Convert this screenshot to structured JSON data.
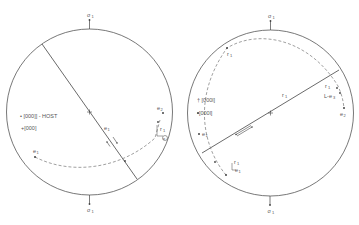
{
  "colors": {
    "stroke": "#444444",
    "dash": "#777777",
    "text": "#555555"
  },
  "left_diagram": {
    "stress_top": "σ",
    "stress_top_sub": "1",
    "stress_bottom": "σ",
    "stress_bottom_sub": "1",
    "legend_host": "• [000]] - HOST",
    "legend_twin": "+[000]",
    "label_e1_line": "e",
    "label_e1_line_sub": "1",
    "label_e2": "e",
    "label_e2_sub": "2",
    "label_r1": "r",
    "label_r1_sub": "1",
    "label_e3": "e",
    "label_e3_sub": "3",
    "label_e1_left": "e",
    "label_e1_left_sub": "1"
  },
  "right_diagram": {
    "stress_top": "σ",
    "stress_top_sub": "1",
    "stress_bottom": "σ",
    "stress_bottom_sub": "1",
    "legend_host": "† [000l]",
    "legend_twin": "•[000l]",
    "label_r1_top": "r",
    "label_r1_top_sub": "1",
    "label_r1_line": "r",
    "label_r1_line_sub": "1",
    "label_r1_right": "r",
    "label_r1_right_sub": "1",
    "label_e3_right": "L-e",
    "label_e3_right_sub": "3",
    "label_e2": "e",
    "label_e2_sub": "2",
    "label_e1": "e",
    "label_e1_sub": "1",
    "label_r1_bottom": "r",
    "label_r1_bottom_sub": "1",
    "label_e1_bottom": "e",
    "label_e1_bottom_sub": "1"
  }
}
